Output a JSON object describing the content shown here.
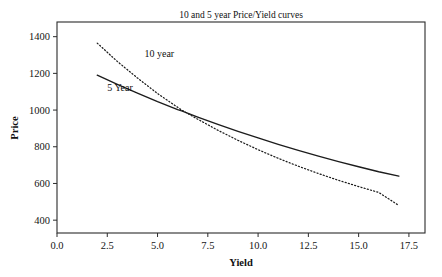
{
  "chart_data": {
    "type": "line",
    "title": "10 and 5 year Price/Yield curves",
    "xlabel": "Yield",
    "ylabel": "Price",
    "xlim": [
      0.0,
      18.3
    ],
    "ylim": [
      330,
      1480
    ],
    "grid": false,
    "legend": "inline-annotations",
    "xticks": [
      "0.0",
      "2.5",
      "5.0",
      "7.5",
      "10.0",
      "12.5",
      "15.0",
      "17.5"
    ],
    "xtick_values": [
      0.0,
      2.5,
      5.0,
      7.5,
      10.0,
      12.5,
      15.0,
      17.5
    ],
    "yticks": [
      "400",
      "600",
      "800",
      "1000",
      "1200",
      "1400"
    ],
    "ytick_values": [
      400,
      600,
      800,
      1000,
      1200,
      1400
    ],
    "series": [
      {
        "name": "10 year",
        "style": "dotted",
        "color": "#1c1c1c",
        "annotation": "10 year",
        "x": [
          2.0,
          3.0,
          4.0,
          5.0,
          6.0,
          6.2,
          7.0,
          8.0,
          9.0,
          10.0,
          11.0,
          12.0,
          13.0,
          14.0,
          15.0,
          16.0,
          17.0
        ],
        "y": [
          1365,
          1265,
          1175,
          1090,
          1015,
          1000,
          950,
          890,
          835,
          784,
          737,
          694,
          654,
          617,
          583,
          551,
          480
        ]
      },
      {
        "name": "5 Year",
        "style": "solid",
        "color": "#1c1c1c",
        "annotation": "5 Year",
        "x": [
          2.0,
          3.0,
          4.0,
          5.0,
          6.0,
          6.2,
          7.0,
          8.0,
          9.0,
          10.0,
          11.0,
          12.0,
          13.0,
          14.0,
          15.0,
          16.0,
          17.0
        ],
        "y": [
          1190,
          1140,
          1092,
          1046,
          1003,
          995,
          962,
          922,
          884,
          848,
          813,
          780,
          749,
          719,
          691,
          664,
          640
        ]
      }
    ],
    "annotations": [
      {
        "label": "10 year",
        "x": 4.35,
        "y": 1290
      },
      {
        "label": "5 Year",
        "x": 2.5,
        "y": 1105
      }
    ]
  }
}
